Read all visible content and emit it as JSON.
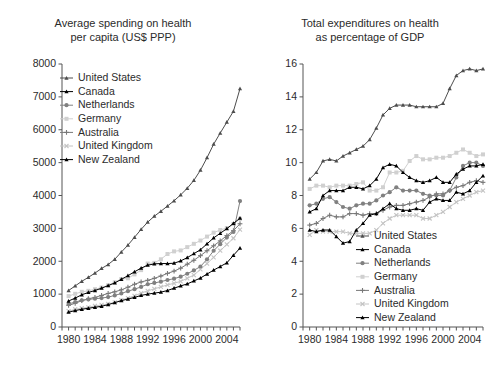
{
  "figure": {
    "width": 493,
    "height": 365,
    "background": "#ffffff"
  },
  "series_style": [
    {
      "key": "united_states",
      "label": "United States",
      "color": "#4d4d4d",
      "marker": "triangle"
    },
    {
      "key": "canada",
      "label": "Canada",
      "color": "#000000",
      "marker": "triangle"
    },
    {
      "key": "netherlands",
      "label": "Netherlands",
      "color": "#808080",
      "marker": "circle"
    },
    {
      "key": "germany",
      "label": "Germany",
      "color": "#d0d0d0",
      "marker": "square"
    },
    {
      "key": "australia",
      "label": "Australia",
      "color": "#787878",
      "marker": "plus"
    },
    {
      "key": "united_kingdom",
      "label": "United Kingdom",
      "color": "#c4c4c4",
      "marker": "cross"
    },
    {
      "key": "new_zealand",
      "label": "New Zealand",
      "color": "#000000",
      "marker": "triangle"
    }
  ],
  "chart_data": [
    {
      "id": "per-capita",
      "type": "line",
      "title": "Average spending on health\nper capita (US$ PPP)",
      "xlabel": "",
      "ylabel": "",
      "xlim": [
        1979,
        2006
      ],
      "ylim": [
        0,
        8000
      ],
      "ytick_values": [
        0,
        1000,
        2000,
        3000,
        4000,
        5000,
        6000,
        7000,
        8000
      ],
      "ytick_labels": [
        "0",
        "1000",
        "2000",
        "3000",
        "4000",
        "5000",
        "6000",
        "7000",
        "8000"
      ],
      "xtick_values": [
        1980,
        1984,
        1988,
        1992,
        1996,
        2000,
        2004
      ],
      "xtick_labels": [
        "1980",
        "1984",
        "1988",
        "1992",
        "1996",
        "2000",
        "2004"
      ],
      "xminor_step": 1,
      "grid": false,
      "legend_position": "upper left",
      "x": [
        1980,
        1981,
        1982,
        1983,
        1984,
        1985,
        1986,
        1987,
        1988,
        1989,
        1990,
        1991,
        1992,
        1993,
        1994,
        1995,
        1996,
        1997,
        1998,
        1999,
        2000,
        2001,
        2002,
        2003,
        2004,
        2005,
        2006
      ],
      "series": [
        {
          "name": "United States",
          "values": [
            1110,
            1250,
            1390,
            1510,
            1640,
            1780,
            1900,
            2060,
            2280,
            2490,
            2730,
            2970,
            3190,
            3370,
            3520,
            3680,
            3840,
            4020,
            4220,
            4460,
            4770,
            5150,
            5560,
            5900,
            6230,
            6560,
            7250
          ]
        },
        {
          "name": "Canada",
          "values": [
            790,
            880,
            980,
            1050,
            1110,
            1180,
            1260,
            1340,
            1450,
            1560,
            1680,
            1790,
            1880,
            1920,
            1930,
            1930,
            1940,
            2010,
            2110,
            2230,
            2350,
            2530,
            2710,
            2850,
            2990,
            3150,
            3310
          ]
        },
        {
          "name": "Netherlands",
          "values": [
            700,
            760,
            810,
            840,
            860,
            880,
            910,
            960,
            1020,
            1090,
            1150,
            1220,
            1300,
            1340,
            1380,
            1430,
            1470,
            1530,
            1620,
            1720,
            1840,
            2060,
            2320,
            2520,
            2720,
            2890,
            3830
          ]
        },
        {
          "name": "Germany",
          "values": [
            940,
            1010,
            1070,
            1100,
            1150,
            1200,
            1270,
            1360,
            1460,
            1480,
            1600,
            1730,
            1930,
            1950,
            2060,
            2220,
            2300,
            2330,
            2430,
            2530,
            2630,
            2750,
            2870,
            2950,
            3010,
            3130,
            3290
          ]
        },
        {
          "name": "Australia",
          "values": [
            660,
            720,
            800,
            860,
            900,
            960,
            1020,
            1070,
            1130,
            1210,
            1300,
            1370,
            1420,
            1480,
            1550,
            1630,
            1700,
            1790,
            1910,
            2030,
            2170,
            2320,
            2470,
            2620,
            2780,
            2930,
            3140
          ]
        },
        {
          "name": "United Kingdom",
          "values": [
            480,
            540,
            570,
            600,
            640,
            670,
            700,
            750,
            820,
            880,
            950,
            1030,
            1100,
            1160,
            1220,
            1280,
            1330,
            1390,
            1480,
            1580,
            1750,
            1930,
            2120,
            2320,
            2510,
            2700,
            2960
          ]
        },
        {
          "name": "New Zealand",
          "values": [
            450,
            500,
            540,
            570,
            600,
            630,
            680,
            740,
            800,
            850,
            900,
            960,
            1000,
            1030,
            1060,
            1110,
            1180,
            1250,
            1310,
            1400,
            1490,
            1610,
            1730,
            1840,
            1950,
            2180,
            2400
          ]
        }
      ]
    },
    {
      "id": "percent-gdp",
      "type": "line",
      "title": "Total expenditures on health\nas percentage of GDP",
      "xlabel": "",
      "ylabel": "",
      "xlim": [
        1979,
        2006
      ],
      "ylim": [
        0,
        16
      ],
      "ytick_values": [
        0,
        2,
        4,
        6,
        8,
        10,
        12,
        14,
        16
      ],
      "ytick_labels": [
        "0",
        "2",
        "4",
        "6",
        "8",
        "10",
        "12",
        "14",
        "16"
      ],
      "xtick_values": [
        1980,
        1984,
        1988,
        1992,
        1996,
        2000,
        2004
      ],
      "xtick_labels": [
        "1980",
        "1984",
        "1988",
        "1992",
        "1996",
        "2000",
        "2004"
      ],
      "xminor_step": 1,
      "grid": false,
      "legend_position": "lower right",
      "x": [
        1980,
        1981,
        1982,
        1983,
        1984,
        1985,
        1986,
        1987,
        1988,
        1989,
        1990,
        1991,
        1992,
        1993,
        1994,
        1995,
        1996,
        1997,
        1998,
        1999,
        2000,
        2001,
        2002,
        2003,
        2004,
        2005,
        2006
      ],
      "series": [
        {
          "name": "United States",
          "values": [
            9.0,
            9.4,
            10.1,
            10.2,
            10.1,
            10.4,
            10.6,
            10.8,
            11.0,
            11.4,
            12.1,
            12.9,
            13.3,
            13.5,
            13.5,
            13.5,
            13.4,
            13.4,
            13.4,
            13.4,
            13.6,
            14.5,
            15.3,
            15.6,
            15.7,
            15.6,
            15.7,
            15.9
          ]
        },
        {
          "name": "Canada",
          "values": [
            7.0,
            7.2,
            8.0,
            8.3,
            8.3,
            8.3,
            8.5,
            8.5,
            8.4,
            8.6,
            9.0,
            9.7,
            9.9,
            9.8,
            9.4,
            9.1,
            8.9,
            8.8,
            8.9,
            9.1,
            8.8,
            8.8,
            9.3,
            9.6,
            9.8,
            9.8,
            9.9,
            10.0
          ]
        },
        {
          "name": "Netherlands",
          "values": [
            7.4,
            7.5,
            7.8,
            7.9,
            7.6,
            7.3,
            7.2,
            7.4,
            7.5,
            7.5,
            7.7,
            8.0,
            8.2,
            8.5,
            8.3,
            8.3,
            8.3,
            8.1,
            8.0,
            8.0,
            8.0,
            8.3,
            9.1,
            9.8,
            10.0,
            10.0,
            9.8,
            9.7
          ]
        },
        {
          "name": "Germany",
          "values": [
            8.4,
            8.6,
            8.6,
            8.5,
            8.6,
            8.6,
            8.6,
            8.7,
            8.8,
            8.3,
            8.3,
            8.5,
            9.4,
            9.4,
            9.5,
            10.1,
            10.4,
            10.2,
            10.2,
            10.3,
            10.3,
            10.4,
            10.6,
            10.8,
            10.6,
            10.4,
            10.5,
            10.4
          ]
        },
        {
          "name": "Australia",
          "values": [
            6.2,
            6.3,
            6.6,
            6.8,
            6.7,
            6.7,
            6.9,
            6.9,
            6.8,
            6.9,
            6.9,
            7.1,
            7.3,
            7.4,
            7.4,
            7.5,
            7.6,
            7.7,
            7.9,
            8.1,
            8.1,
            8.3,
            8.5,
            8.6,
            8.8,
            8.9,
            8.8,
            8.7
          ]
        },
        {
          "name": "United Kingdom",
          "values": [
            5.6,
            5.9,
            5.8,
            5.8,
            5.8,
            5.8,
            5.7,
            5.7,
            5.7,
            5.7,
            5.9,
            6.3,
            6.6,
            6.8,
            6.8,
            6.8,
            6.8,
            6.6,
            6.6,
            6.8,
            7.0,
            7.3,
            7.6,
            7.8,
            8.0,
            8.2,
            8.3,
            8.4
          ]
        },
        {
          "name": "New Zealand",
          "values": [
            5.9,
            5.8,
            5.9,
            5.9,
            5.5,
            5.1,
            5.2,
            5.9,
            6.3,
            6.8,
            6.9,
            7.2,
            7.5,
            7.2,
            7.1,
            7.1,
            7.2,
            7.1,
            7.6,
            7.8,
            7.7,
            7.7,
            8.2,
            8.1,
            8.3,
            8.8,
            9.2,
            9.3
          ]
        }
      ]
    }
  ]
}
